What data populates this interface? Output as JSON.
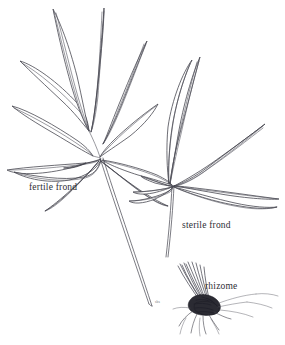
{
  "illustration": {
    "type": "botanical-line-drawing",
    "subject": "fern with fertile and sterile fronds and rhizome",
    "background_color": "#ffffff",
    "ink_color": "#3c3c46",
    "rhizome_color": "#2b2b33"
  },
  "labels": {
    "fertile_frond": "fertile frond",
    "sterile_frond": "sterile frond",
    "rhizome": "rhizome",
    "artist_mark": "sbs"
  },
  "parts": [
    {
      "name": "fertile-frond",
      "label": "fertile frond",
      "leaflet_count": 9
    },
    {
      "name": "sterile-frond",
      "label": "sterile frond",
      "leaflet_count": 7
    },
    {
      "name": "rhizome",
      "label": "rhizome",
      "root_count": 9
    }
  ]
}
